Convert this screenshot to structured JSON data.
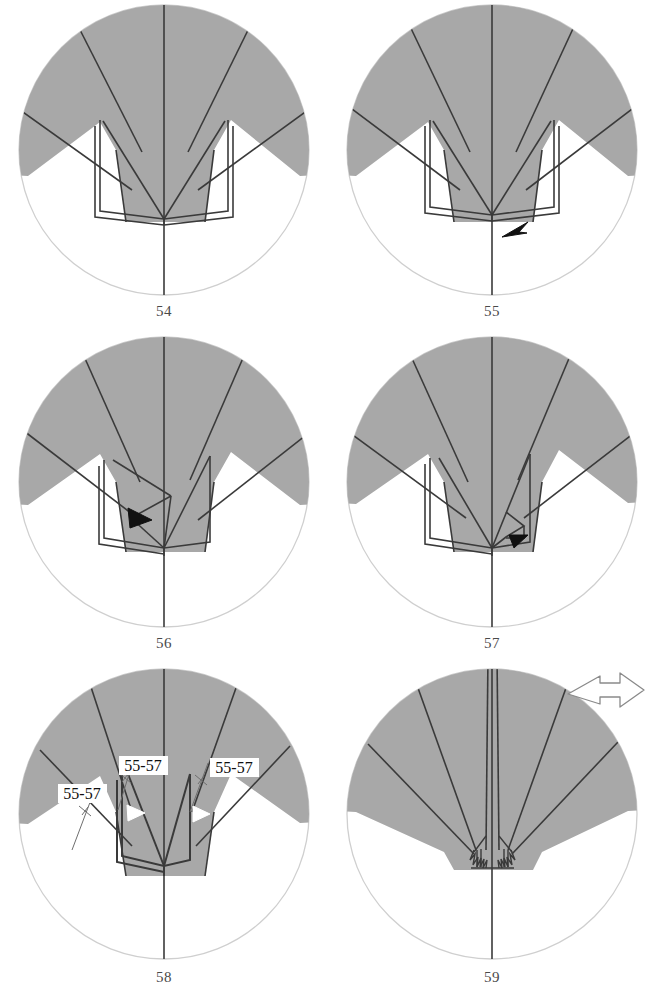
{
  "document": {
    "type": "origami-folding-diagram",
    "page_background": "#ffffff",
    "paper_fill": "#a8a8a8",
    "crease_line_color": "#3a3a3a",
    "circle_outline_color": "#cfcfcf",
    "label_box_fill": "#ffffff",
    "label_text_color": "#1a1a1a",
    "number_color": "#4a4a4a"
  },
  "panels": [
    {
      "number": "54",
      "has_arrow": false,
      "arrow_style": "",
      "has_turn_over_arrow": false,
      "labels": []
    },
    {
      "number": "55",
      "has_arrow": true,
      "arrow_style": "solid-black-arrowhead",
      "has_turn_over_arrow": false,
      "labels": []
    },
    {
      "number": "56",
      "has_arrow": true,
      "arrow_style": "solid-black-arrowhead",
      "has_turn_over_arrow": false,
      "labels": []
    },
    {
      "number": "57",
      "has_arrow": true,
      "arrow_style": "solid-black-arrowhead",
      "has_turn_over_arrow": false,
      "labels": []
    },
    {
      "number": "58",
      "has_arrow": false,
      "arrow_style": "hollow-white-arrowhead",
      "has_turn_over_arrow": false,
      "labels": [
        {
          "text": "55-57",
          "x": 119,
          "y": 102
        },
        {
          "text": "55-57",
          "x": 215,
          "y": 104
        },
        {
          "text": "55-57",
          "x": 62,
          "y": 130
        }
      ]
    },
    {
      "number": "59",
      "has_arrow": false,
      "arrow_style": "",
      "has_turn_over_arrow": true,
      "labels": []
    }
  ]
}
